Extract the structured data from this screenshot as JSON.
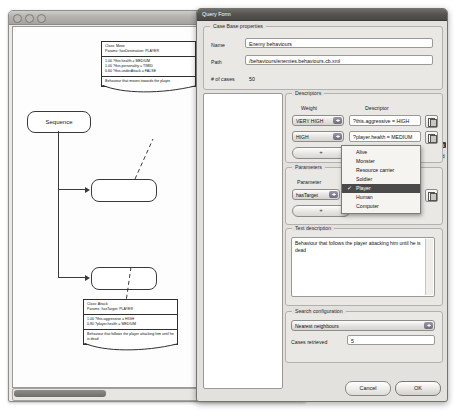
{
  "back_window": {
    "name": "diagram-window",
    "traffic_lights": [
      "close",
      "minimize",
      "zoom"
    ],
    "diagram": {
      "nodes": [
        {
          "id": "sequence",
          "label": "Sequence"
        },
        {
          "id": "task1",
          "label": ""
        },
        {
          "id": "task2",
          "label": ""
        }
      ],
      "notes": [
        {
          "id": "note-move",
          "header": [
            "Class: Move",
            "Params: hasDestination: PLAYER"
          ],
          "weights": [
            "1.00 ?this.health = MEDIUM",
            "1.00 ?this.personality = TIMID",
            "0.60 ?this.underAttack = FALSE"
          ],
          "description": "Behaviour that moves towards the player"
        },
        {
          "id": "note-attack",
          "header": [
            "Class: Attack",
            "Params: hasTarget: PLAYER"
          ],
          "weights": [
            "1.00 ?this.aggressive = HIGH",
            "0.80 ?player.health = MEDIUM"
          ],
          "description": "Behaviour that follows the player attacking him until he is dead"
        }
      ]
    }
  },
  "dialog": {
    "title": "Query Form",
    "case_base": {
      "group_label": "Case Base properties",
      "name_label": "Name",
      "name_value": "Enemy behaviours",
      "path_label": "Path",
      "path_value": "/behaviours/enemies.behaviours.cb.xml",
      "cases_label": "# of cases",
      "cases_value": "50"
    },
    "tree": {
      "items": [
        {
          "label": "Behaviour",
          "depth": 0,
          "selected": false,
          "expanded": false
        },
        {
          "label": "Hunt",
          "depth": 1,
          "selected": false,
          "expanded": false
        },
        {
          "label": "Move",
          "depth": 1,
          "selected": false,
          "expanded": false
        },
        {
          "label": "Confront",
          "depth": 1,
          "selected": false,
          "expanded": true
        },
        {
          "label": "Attack",
          "depth": 2,
          "selected": true,
          "expanded": false
        },
        {
          "label": "Defend",
          "depth": 2,
          "selected": false,
          "expanded": false
        }
      ]
    },
    "descriptors": {
      "group_label": "Descriptors",
      "col_weight": "Weight",
      "col_descriptor": "Descriptor",
      "rows": [
        {
          "weight": "VERY HIGH",
          "descriptor": "?this.aggressive = HIGH"
        },
        {
          "weight": "HIGH",
          "descriptor": "?player.health = MEDIUM"
        }
      ],
      "add_label": "+"
    },
    "parameters": {
      "group_label": "Parameters",
      "col_parameter": "Parameter",
      "rows": [
        {
          "parameter": "hasTarget",
          "value": "Player"
        }
      ],
      "add_label": "+"
    },
    "parameter_menu": {
      "open": true,
      "options": [
        "Alive",
        "Monster",
        "Resource carrier",
        "Soldier",
        "Player",
        "Human",
        "Computer"
      ],
      "selected": "Player",
      "check_glyph": "✓"
    },
    "text_description": {
      "group_label": "Text description",
      "value": "Behaviour that follows the player attacking him until he is dead"
    },
    "search_configuration": {
      "group_label": "Search configuration",
      "method": "Nearest neighbours",
      "cases_retrieved_label": "Cases retrieved",
      "cases_retrieved_value": "5"
    },
    "buttons": {
      "cancel": "Cancel",
      "ok": "OK"
    }
  }
}
